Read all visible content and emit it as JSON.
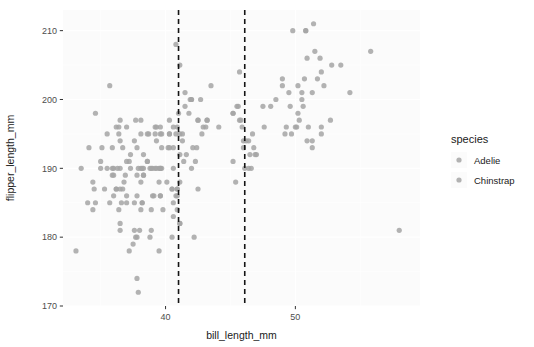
{
  "chart_data": {
    "type": "scatter",
    "title": "",
    "xlabel": "bill_length_mm",
    "ylabel": "flipper_length_mm",
    "xlim": [
      32.1,
      59.6
    ],
    "ylim": [
      170,
      213
    ],
    "xticks": [
      40,
      50
    ],
    "xticklabels": [
      "40",
      "50"
    ],
    "yticks": [
      170,
      180,
      190,
      200,
      210
    ],
    "yticklabels": [
      "170",
      "180",
      "190",
      "200",
      "210"
    ],
    "grid": true,
    "grid_color": "#ffffff",
    "panel_background": "#fbfbfb",
    "point_color": "#a5a5a5",
    "point_opacity": 0.85,
    "point_radius": 2.6,
    "legend": {
      "title": "species",
      "position": "right",
      "entries": [
        {
          "label": "Adelie",
          "color": "#a5a5a5"
        },
        {
          "label": "Chinstrap",
          "color": "#a5a5a5"
        }
      ]
    },
    "annotations": [
      {
        "kind": "vline",
        "x": 41.0,
        "style": "dashed",
        "color": "#141414"
      },
      {
        "kind": "vline",
        "x": 46.1,
        "style": "dashed",
        "color": "#141414"
      }
    ],
    "series": [
      {
        "name": "Adelie",
        "color": "#a5a5a5",
        "points": [
          [
            39.1,
            186
          ],
          [
            39.5,
            190
          ],
          [
            40.3,
            195
          ],
          [
            36.7,
            193
          ],
          [
            39.3,
            190
          ],
          [
            38.9,
            181
          ],
          [
            39.2,
            195
          ],
          [
            34.1,
            193
          ],
          [
            42.0,
            190
          ],
          [
            37.8,
            186
          ],
          [
            37.8,
            180
          ],
          [
            41.1,
            182
          ],
          [
            38.6,
            191
          ],
          [
            34.6,
            198
          ],
          [
            36.6,
            185
          ],
          [
            38.7,
            195
          ],
          [
            42.5,
            197
          ],
          [
            34.4,
            184
          ],
          [
            46.0,
            194
          ],
          [
            37.8,
            174
          ],
          [
            37.7,
            180
          ],
          [
            35.9,
            189
          ],
          [
            38.2,
            185
          ],
          [
            38.8,
            180
          ],
          [
            35.3,
            187
          ],
          [
            40.6,
            183
          ],
          [
            40.5,
            187
          ],
          [
            37.9,
            172
          ],
          [
            40.5,
            180
          ],
          [
            39.5,
            178
          ],
          [
            37.2,
            178
          ],
          [
            39.5,
            188
          ],
          [
            40.9,
            184
          ],
          [
            36.4,
            195
          ],
          [
            39.2,
            196
          ],
          [
            38.8,
            190
          ],
          [
            42.2,
            180
          ],
          [
            37.6,
            181
          ],
          [
            39.8,
            184
          ],
          [
            36.5,
            182
          ],
          [
            40.8,
            195
          ],
          [
            36.0,
            186
          ],
          [
            44.1,
            196
          ],
          [
            37.0,
            185
          ],
          [
            39.6,
            190
          ],
          [
            41.1,
            182
          ],
          [
            37.5,
            179
          ],
          [
            36.0,
            190
          ],
          [
            42.3,
            191
          ],
          [
            39.6,
            186
          ],
          [
            40.1,
            188
          ],
          [
            35.0,
            190
          ],
          [
            42.0,
            200
          ],
          [
            34.5,
            187
          ],
          [
            41.4,
            191
          ],
          [
            39.0,
            186
          ],
          [
            40.6,
            193
          ],
          [
            36.5,
            181
          ],
          [
            37.6,
            194
          ],
          [
            35.7,
            185
          ],
          [
            41.3,
            195
          ],
          [
            37.6,
            185
          ],
          [
            41.1,
            192
          ],
          [
            36.4,
            184
          ],
          [
            41.6,
            192
          ],
          [
            35.5,
            195
          ],
          [
            41.1,
            188
          ],
          [
            35.9,
            190
          ],
          [
            41.8,
            198
          ],
          [
            33.5,
            190
          ],
          [
            39.7,
            190
          ],
          [
            39.6,
            196
          ],
          [
            45.8,
            197
          ],
          [
            35.5,
            190
          ],
          [
            42.8,
            195
          ],
          [
            40.9,
            187
          ],
          [
            37.2,
            191
          ],
          [
            36.2,
            187
          ],
          [
            42.1,
            193
          ],
          [
            34.6,
            185
          ],
          [
            42.9,
            196
          ],
          [
            36.7,
            187
          ],
          [
            35.1,
            193
          ],
          [
            37.3,
            192
          ],
          [
            41.3,
            194
          ],
          [
            36.3,
            190
          ],
          [
            36.9,
            189
          ],
          [
            38.3,
            189
          ],
          [
            38.9,
            190
          ],
          [
            35.7,
            202
          ],
          [
            41.1,
            205
          ],
          [
            34.0,
            185
          ],
          [
            39.6,
            186
          ],
          [
            36.2,
            187
          ],
          [
            40.8,
            208
          ],
          [
            38.1,
            190
          ],
          [
            40.3,
            195
          ],
          [
            33.1,
            178
          ],
          [
            43.2,
            197
          ],
          [
            35.0,
            191
          ],
          [
            41.0,
            198
          ],
          [
            37.7,
            197
          ],
          [
            37.8,
            193
          ],
          [
            37.9,
            190
          ],
          [
            39.7,
            195
          ],
          [
            38.6,
            195
          ],
          [
            38.2,
            190
          ],
          [
            38.1,
            188
          ],
          [
            45.2,
            198
          ],
          [
            36.5,
            190
          ],
          [
            39.0,
            190
          ],
          [
            37.0,
            186
          ],
          [
            36.5,
            197
          ],
          [
            36.5,
            194
          ],
          [
            42.7,
            200
          ],
          [
            43.1,
            196
          ],
          [
            40.6,
            190
          ],
          [
            38.3,
            190
          ],
          [
            40.2,
            193
          ],
          [
            37.0,
            191
          ],
          [
            40.3,
            193
          ],
          [
            37.0,
            196
          ],
          [
            36.8,
            188
          ],
          [
            40.6,
            185
          ],
          [
            38.1,
            184
          ],
          [
            38.3,
            192
          ],
          [
            40.9,
            196
          ],
          [
            38.0,
            181
          ],
          [
            40.8,
            186
          ],
          [
            38.3,
            189
          ],
          [
            35.9,
            193
          ],
          [
            40.3,
            197
          ],
          [
            40.5,
            187
          ],
          [
            37.8,
            189
          ],
          [
            36.0,
            189
          ],
          [
            40.6,
            196
          ],
          [
            41.5,
            201
          ],
          [
            36.2,
            196
          ],
          [
            39.3,
            194
          ],
          [
            38.6,
            191
          ],
          [
            38.1,
            197
          ],
          [
            36.4,
            196
          ],
          [
            38.9,
            184
          ],
          [
            39.6,
            190
          ],
          [
            34.4,
            188
          ],
          [
            41.9,
            200
          ],
          [
            36.5,
            187
          ],
          [
            38.1,
            195
          ],
          [
            39.6,
            195
          ],
          [
            40.9,
            186
          ],
          [
            38.2,
            185
          ],
          [
            39.3,
            196
          ],
          [
            42.0,
            200
          ],
          [
            39.7,
            193
          ],
          [
            37.3,
            190
          ],
          [
            39.2,
            190
          ],
          [
            41.1,
            195
          ],
          [
            41.5,
            199
          ]
        ]
      },
      {
        "name": "Chinstrap",
        "color": "#a5a5a5",
        "points": [
          [
            46.5,
            192
          ],
          [
            50.0,
            196
          ],
          [
            51.3,
            193
          ],
          [
            45.4,
            188
          ],
          [
            52.7,
            197
          ],
          [
            45.2,
            198
          ],
          [
            46.1,
            190
          ],
          [
            51.3,
            194
          ],
          [
            46.0,
            193
          ],
          [
            51.3,
            201
          ],
          [
            46.6,
            190
          ],
          [
            51.7,
            203
          ],
          [
            47.0,
            192
          ],
          [
            52.0,
            195
          ],
          [
            45.9,
            196
          ],
          [
            50.5,
            200
          ],
          [
            50.3,
            197
          ],
          [
            58.0,
            181
          ],
          [
            46.4,
            194
          ],
          [
            49.2,
            195
          ],
          [
            42.4,
            193
          ],
          [
            48.5,
            200
          ],
          [
            43.2,
            197
          ],
          [
            50.6,
            199
          ],
          [
            46.7,
            195
          ],
          [
            52.0,
            196
          ],
          [
            50.5,
            201
          ],
          [
            49.5,
            201
          ],
          [
            46.4,
            190
          ],
          [
            52.8,
            205
          ],
          [
            40.9,
            187
          ],
          [
            54.2,
            201
          ],
          [
            42.5,
            187
          ],
          [
            51.0,
            196
          ],
          [
            49.7,
            195
          ],
          [
            47.5,
            199
          ],
          [
            47.6,
            196
          ],
          [
            52.0,
            204
          ],
          [
            46.9,
            192
          ],
          [
            53.5,
            205
          ],
          [
            49.0,
            202
          ],
          [
            46.2,
            194
          ],
          [
            50.9,
            194
          ],
          [
            45.5,
            199
          ],
          [
            50.9,
            206
          ],
          [
            50.8,
            210
          ],
          [
            50.1,
            196
          ],
          [
            49.0,
            203
          ],
          [
            51.5,
            207
          ],
          [
            49.8,
            210
          ],
          [
            48.1,
            199
          ],
          [
            51.4,
            211
          ],
          [
            45.7,
            197
          ],
          [
            50.7,
            203
          ],
          [
            42.5,
            197
          ],
          [
            52.2,
            202
          ],
          [
            45.2,
            191
          ],
          [
            49.3,
            196
          ],
          [
            50.2,
            202
          ],
          [
            45.6,
            199
          ],
          [
            51.9,
            206
          ],
          [
            46.8,
            193
          ],
          [
            45.7,
            204
          ],
          [
            55.8,
            207
          ],
          [
            43.5,
            202
          ],
          [
            49.6,
            199
          ],
          [
            50.8,
            210
          ],
          [
            50.2,
            198
          ]
        ]
      }
    ]
  }
}
